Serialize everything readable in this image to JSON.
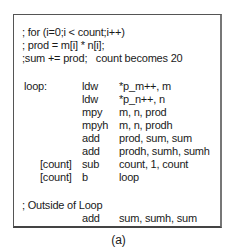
{
  "comments": [
    "; for (i=0;i < count;i++)",
    "; prod = m[i] * n[i];",
    ";sum += prod;   count becomes 20"
  ],
  "loop": {
    "label": "loop:",
    "instructions": [
      {
        "cond": "",
        "mnemonic": "ldw",
        "operands": "*p_m++, m"
      },
      {
        "cond": "",
        "mnemonic": "ldw",
        "operands": "*p_n++, n"
      },
      {
        "cond": "",
        "mnemonic": "mpy",
        "operands": "m, n, prod"
      },
      {
        "cond": "",
        "mnemonic": "mpyh",
        "operands": "m, n, prodh"
      },
      {
        "cond": "",
        "mnemonic": "add",
        "operands": "prod, sum, sum"
      },
      {
        "cond": "",
        "mnemonic": "add",
        "operands": "prodh, sumh, sumh"
      },
      {
        "cond": "[count]",
        "mnemonic": "sub",
        "operands": "count, 1, count"
      },
      {
        "cond": "[count]",
        "mnemonic": "b",
        "operands": "loop"
      }
    ]
  },
  "outside": {
    "comment": "; Outside of Loop",
    "instructions": [
      {
        "mnemonic": "add",
        "operands": "sum, sumh, sum"
      }
    ]
  },
  "caption": "(a)"
}
